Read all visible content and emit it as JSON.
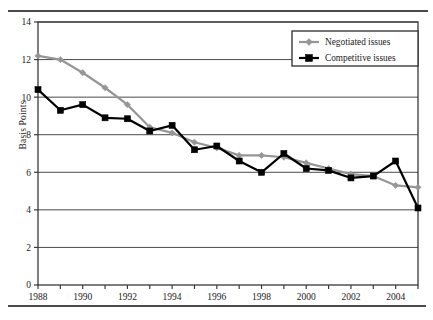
{
  "chart_data": {
    "type": "line",
    "title": "",
    "xlabel": "",
    "ylabel": "Basis Points",
    "xlim": [
      1988,
      2005
    ],
    "ylim": [
      0,
      14
    ],
    "ytick_values": [
      0,
      2,
      4,
      6,
      8,
      10,
      12,
      14
    ],
    "ytick_labels": [
      "0",
      "2",
      "4",
      "6",
      "8",
      "10",
      "12",
      "14"
    ],
    "xtick_values": [
      1988,
      1989,
      1990,
      1991,
      1992,
      1993,
      1994,
      1995,
      1996,
      1997,
      1998,
      1999,
      2000,
      2001,
      2002,
      2003,
      2004,
      2005
    ],
    "xtick_labels": [
      "1988",
      "",
      "1990",
      "",
      "1992",
      "",
      "1994",
      "",
      "1996",
      "",
      "1998",
      "",
      "2000",
      "",
      "2002",
      "",
      "2004",
      ""
    ],
    "xtick_labels_shown": [
      "1988",
      "1990",
      "1992",
      "1994",
      "1996",
      "1998",
      "2000",
      "2002",
      "2004"
    ],
    "grid": "horizontal",
    "legend_position": "top-right",
    "x": [
      1988,
      1989,
      1990,
      1991,
      1992,
      1993,
      1994,
      1995,
      1996,
      1997,
      1998,
      1999,
      2000,
      2001,
      2002,
      2003,
      2004,
      2005
    ],
    "series": [
      {
        "name": "Negotiated issues",
        "color": "#969696",
        "marker": "diamond",
        "values": [
          12.2,
          12.0,
          11.3,
          10.5,
          9.6,
          8.4,
          8.1,
          7.6,
          7.3,
          6.9,
          6.9,
          6.8,
          6.5,
          6.2,
          5.9,
          5.8,
          5.3,
          5.2
        ]
      },
      {
        "name": "Competitive issues",
        "color": "#000000",
        "marker": "square",
        "values": [
          10.4,
          9.3,
          9.6,
          8.9,
          8.85,
          8.2,
          8.5,
          7.2,
          7.4,
          6.6,
          6.0,
          7.0,
          6.2,
          6.1,
          5.7,
          5.8,
          6.6,
          4.1
        ]
      }
    ]
  },
  "legend": {
    "items": [
      {
        "label": "Negotiated issues"
      },
      {
        "label": "Competitive issues"
      }
    ]
  },
  "axis": {
    "y_title": "Basis Points"
  },
  "colors": {
    "negotiated": "#969696",
    "competitive": "#000000",
    "frame": "#3a3a3a",
    "gridline": "#4a4a4a"
  }
}
